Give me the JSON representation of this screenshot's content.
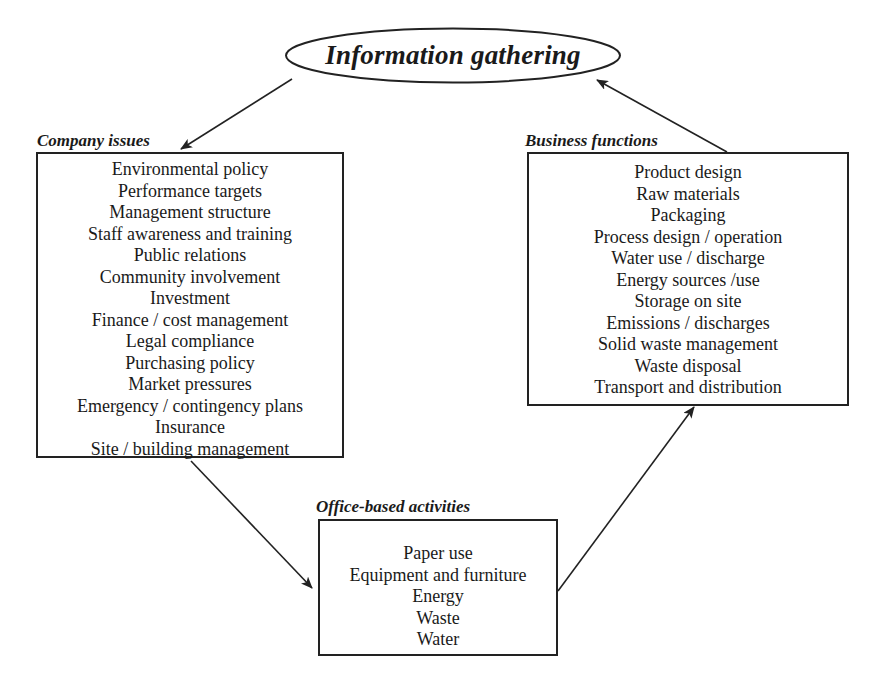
{
  "diagram": {
    "center": {
      "label": "Information gathering"
    },
    "groups": [
      {
        "id": "company-issues",
        "title": "Company issues",
        "items": [
          "Environmental policy",
          "Performance targets",
          "Management structure",
          "Staff awareness and training",
          "Public relations",
          "Community involvement",
          "Investment",
          "Finance / cost management",
          "Legal compliance",
          "Purchasing policy",
          "Market pressures",
          "Emergency / contingency plans",
          "Insurance",
          "Site / building management"
        ]
      },
      {
        "id": "business-functions",
        "title": "Business functions",
        "items": [
          "Product design",
          "Raw materials",
          "Packaging",
          "Process design / operation",
          "Water use / discharge",
          "Energy sources /use",
          "Storage on site",
          "Emissions / discharges",
          "Solid waste management",
          "Waste disposal",
          "Transport and distribution"
        ]
      },
      {
        "id": "office-based-activities",
        "title": "Office-based activities",
        "items": [
          "Paper use",
          "Equipment and furniture",
          "Energy",
          "Waste",
          "Water"
        ]
      }
    ],
    "flow": [
      {
        "from": "Information gathering",
        "to": "Company issues"
      },
      {
        "from": "Company issues",
        "to": "Office-based activities"
      },
      {
        "from": "Office-based activities",
        "to": "Business functions"
      },
      {
        "from": "Business functions",
        "to": "Information gathering"
      }
    ],
    "colors": {
      "stroke": "#222222",
      "text": "#1a1a1a",
      "background": "#ffffff"
    }
  }
}
